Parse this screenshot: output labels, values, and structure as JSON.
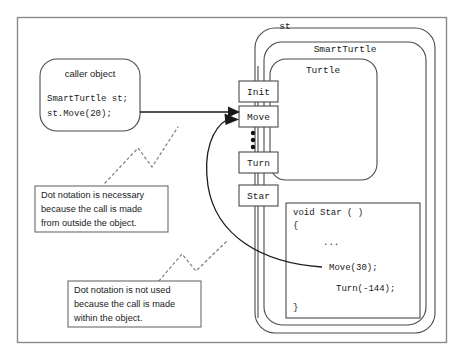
{
  "figure": {
    "frame_color": "#8a8a8a",
    "background": "#ffffff",
    "line_color": "#4a4a4a"
  },
  "caller": {
    "heading": "caller object",
    "code_lines": [
      "SmartTurtle st;",
      "st.Move(20);"
    ]
  },
  "containers": [
    {
      "name": "object-container-st",
      "label": "st"
    },
    {
      "name": "class-container-smartturtle",
      "label": "SmartTurtle"
    },
    {
      "name": "class-container-turtle",
      "label": "Turtle"
    }
  ],
  "methods": [
    {
      "name": "method-box-init",
      "label": "Init"
    },
    {
      "name": "method-box-move",
      "label": "Move"
    },
    {
      "name": "method-box-turn",
      "label": "Turn"
    },
    {
      "name": "method-box-star",
      "label": "Star"
    }
  ],
  "ellipsis": {
    "label": "vertical-ellipsis",
    "dot_count": 3
  },
  "star_code": {
    "lines": [
      "void Star ( )",
      "{",
      "...",
      "Move(30);",
      "Turn(-144);",
      "}"
    ]
  },
  "callouts": [
    {
      "name": "callout-outside",
      "lines": [
        "Dot notation is necessary",
        "because the call is made",
        "from outside the object."
      ]
    },
    {
      "name": "callout-inside",
      "lines": [
        "Dot notation is not used",
        "because the call is made",
        "within the object."
      ]
    }
  ],
  "arrows": [
    {
      "name": "arrow-external-call",
      "from": "caller object",
      "to": "Move"
    },
    {
      "name": "arrow-internal-call",
      "from": "Move(30);",
      "to": "Move"
    }
  ]
}
